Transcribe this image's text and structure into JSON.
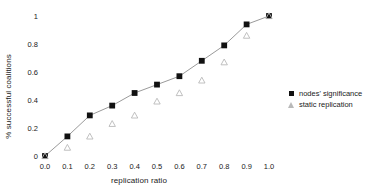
{
  "chart_data": {
    "type": "scatter",
    "title": "",
    "xlabel": "replication ratio",
    "ylabel": "% successful coalitions",
    "x": [
      0.0,
      0.1,
      0.2,
      0.3,
      0.4,
      0.5,
      0.6,
      0.7,
      0.8,
      0.9,
      1.0
    ],
    "xtick_labels": [
      "0.0",
      "0.1",
      "0.2",
      "0.3",
      "0.4",
      "0.5",
      "0.6",
      "0.7",
      "0.8",
      "0.9",
      "1.0"
    ],
    "ytick_labels": [
      "0",
      "0.2",
      "0.4",
      "0.6",
      "0.8",
      "1"
    ],
    "ytick_values": [
      0,
      0.2,
      0.4,
      0.6,
      0.8,
      1
    ],
    "xlim": [
      0.0,
      1.0
    ],
    "ylim": [
      0,
      1
    ],
    "grid": false,
    "legend_position": "right",
    "series": [
      {
        "name": "nodes' significance",
        "marker": "square",
        "marker_color": "#111111",
        "line": true,
        "line_color": "#9a9a9a",
        "values": [
          0.0,
          0.14,
          0.29,
          0.36,
          0.45,
          0.51,
          0.57,
          0.68,
          0.79,
          0.94,
          1.0
        ]
      },
      {
        "name": "static replication",
        "marker": "triangle",
        "marker_color": "#b9b9b9",
        "line": false,
        "line_color": "",
        "values": [
          0.0,
          0.06,
          0.14,
          0.23,
          0.29,
          0.39,
          0.45,
          0.54,
          0.67,
          0.86,
          1.0
        ]
      }
    ]
  },
  "legend": {
    "items": [
      {
        "label": "nodes' significance",
        "marker": "square-marker-icon"
      },
      {
        "label": "static replication",
        "marker": "triangle-marker-icon"
      }
    ]
  },
  "colors": {
    "series_primary": "#111111",
    "series_secondary": "#b9b9b9",
    "line": "#9a9a9a",
    "text": "#1a1a1a",
    "background": "#ffffff"
  }
}
